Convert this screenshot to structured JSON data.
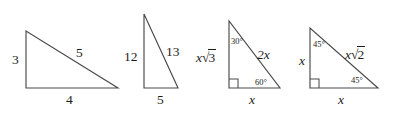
{
  "figure": {
    "background_color": "#ffffff",
    "stroke_color": "#4a4a4a",
    "text_color": "#1c1c1c",
    "triangles": [
      {
        "name": "triangle-3-4-5",
        "labels": {
          "vertical_leg": "3",
          "horizontal_leg": "4",
          "hypotenuse": "5"
        }
      },
      {
        "name": "triangle-5-12-13",
        "labels": {
          "vertical_leg": "12",
          "horizontal_leg": "5",
          "hypotenuse": "13"
        }
      },
      {
        "name": "triangle-30-60-90",
        "labels": {
          "vertical_leg_x": "x",
          "vertical_leg_root": "3",
          "horizontal_leg": "x",
          "hypotenuse": "2x",
          "top_angle": "30°",
          "bottom_right_angle": "60°",
          "right_angle_marker": "right-angle"
        }
      },
      {
        "name": "triangle-45-45-90",
        "labels": {
          "vertical_leg": "x",
          "horizontal_leg": "x",
          "hypotenuse_x": "x",
          "hypotenuse_root": "2",
          "top_angle": "45°",
          "bottom_right_angle": "45°",
          "right_angle_marker": "right-angle"
        }
      }
    ]
  }
}
